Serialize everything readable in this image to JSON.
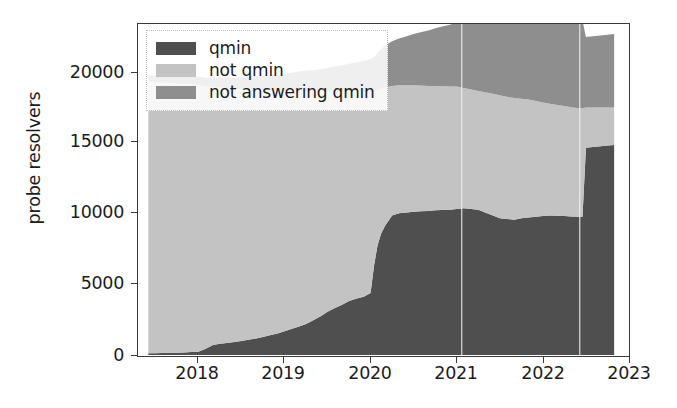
{
  "chart_data": {
    "type": "area",
    "title": "",
    "xlabel": "",
    "ylabel": "probe resolvers",
    "stacked": true,
    "grid": false,
    "legend_position": "upper left",
    "xlim": [
      2017.3,
      2023.0
    ],
    "ylim": [
      0,
      23000
    ],
    "xticks": [
      "2018",
      "2019",
      "2020",
      "2021",
      "2022",
      "2023"
    ],
    "xtick_values": [
      2018,
      2019,
      2020,
      2021,
      2022,
      2023
    ],
    "yticks": [
      "0",
      "5000",
      "10000",
      "15000",
      "20000"
    ],
    "ytick_values": [
      0,
      5000,
      10000,
      15000,
      20000
    ],
    "colors": {
      "qmin": "#4f4f4f",
      "not_qmin": "#c3c3c3",
      "not_answering_qmin": "#8e8e8e",
      "axis": "#3a3a3a",
      "text": "#1c1c1c",
      "background": "#ffffff"
    },
    "x": [
      2017.42,
      2017.5,
      2017.58,
      2017.67,
      2017.75,
      2017.83,
      2017.92,
      2018.0,
      2018.08,
      2018.17,
      2018.25,
      2018.33,
      2018.42,
      2018.5,
      2018.58,
      2018.67,
      2018.75,
      2018.83,
      2018.92,
      2019.0,
      2019.08,
      2019.17,
      2019.25,
      2019.33,
      2019.42,
      2019.5,
      2019.58,
      2019.67,
      2019.75,
      2019.83,
      2019.92,
      2020.0,
      2020.04,
      2020.08,
      2020.12,
      2020.17,
      2020.25,
      2020.33,
      2020.42,
      2020.5,
      2020.58,
      2020.67,
      2020.75,
      2020.83,
      2020.92,
      2021.0,
      2021.08,
      2021.17,
      2021.25,
      2021.33,
      2021.42,
      2021.5,
      2021.58,
      2021.67,
      2021.75,
      2021.83,
      2021.92,
      2022.0,
      2022.08,
      2022.17,
      2022.25,
      2022.33,
      2022.42,
      2022.46,
      2022.5,
      2022.58,
      2022.67,
      2022.75,
      2022.83
    ],
    "series": [
      {
        "name": "qmin",
        "values": [
          120,
          130,
          140,
          150,
          160,
          180,
          200,
          230,
          420,
          700,
          780,
          840,
          900,
          980,
          1060,
          1150,
          1250,
          1380,
          1500,
          1650,
          1800,
          1980,
          2150,
          2400,
          2700,
          3000,
          3250,
          3500,
          3750,
          3900,
          4050,
          4300,
          6200,
          7600,
          8400,
          9000,
          9700,
          9850,
          9900,
          9950,
          9980,
          10000,
          10050,
          10080,
          10100,
          10150,
          10200,
          10150,
          10100,
          9900,
          9700,
          9500,
          9450,
          9400,
          9500,
          9550,
          9600,
          9650,
          9700,
          9680,
          9650,
          9620,
          9600,
          9600,
          14400,
          14450,
          14500,
          14550,
          14600
        ]
      },
      {
        "name": "not qmin",
        "values": [
          18900,
          18850,
          18800,
          18750,
          18700,
          18650,
          18600,
          18550,
          18250,
          17900,
          17800,
          17700,
          17600,
          17500,
          17400,
          17300,
          17150,
          17000,
          16850,
          16700,
          16550,
          16400,
          16200,
          15900,
          15600,
          15300,
          15050,
          14800,
          14550,
          14400,
          14250,
          14000,
          12100,
          10800,
          10100,
          9600,
          9000,
          8900,
          8850,
          8800,
          8750,
          8700,
          8650,
          8600,
          8550,
          8500,
          8350,
          8300,
          8250,
          8350,
          8450,
          8550,
          8500,
          8450,
          8300,
          8200,
          8050,
          7900,
          7750,
          7700,
          7650,
          7600,
          7550,
          7550,
          2800,
          2750,
          2700,
          2650,
          2600
        ]
      },
      {
        "name": "not answering qmin",
        "values": [
          400,
          420,
          450,
          470,
          500,
          520,
          550,
          580,
          620,
          660,
          700,
          740,
          790,
          840,
          890,
          950,
          1000,
          1060,
          1120,
          1180,
          1250,
          1320,
          1400,
          1480,
          1560,
          1650,
          1740,
          1830,
          1930,
          2030,
          2140,
          2250,
          2400,
          2600,
          2750,
          2900,
          3100,
          3250,
          3400,
          3550,
          3700,
          3850,
          4000,
          4150,
          4300,
          4450,
          4600,
          4750,
          4900,
          5000,
          5100,
          5200,
          5300,
          5400,
          5500,
          5600,
          5700,
          5800,
          5900,
          5950,
          6000,
          6050,
          6100,
          6100,
          4900,
          4950,
          5000,
          5050,
          5100
        ]
      }
    ],
    "data_gaps": [
      2021.06,
      2022.43
    ],
    "notes": {
      "qmin_start": 120,
      "qmin_end": 14600,
      "total_start": 19420,
      "total_end": 22300,
      "major_qmin_step_year": 2020,
      "second_qmin_step_year": 2022.5
    }
  },
  "axis": {
    "ylabel": "probe resolvers",
    "yticks": [
      "20000",
      "15000",
      "10000",
      "5000",
      "0"
    ],
    "xticks": [
      "2018",
      "2019",
      "2020",
      "2021",
      "2022",
      "2023"
    ]
  },
  "legend": {
    "items": [
      {
        "label": "qmin",
        "color": "#4f4f4f"
      },
      {
        "label": "not qmin",
        "color": "#c3c3c3"
      },
      {
        "label": "not answering qmin",
        "color": "#8e8e8e"
      }
    ]
  }
}
